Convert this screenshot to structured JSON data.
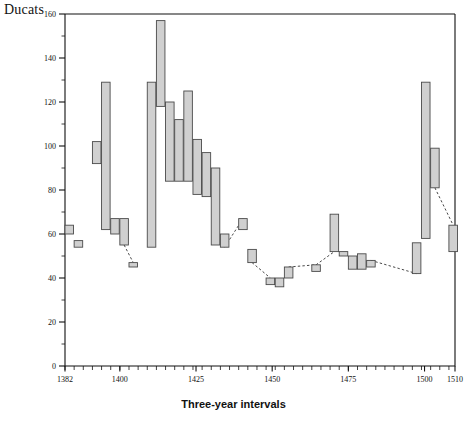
{
  "chart_data": {
    "type": "bar",
    "subtype": "high-low-range-bars",
    "title": "",
    "xlabel": "Three-year intervals",
    "ylabel": "Ducats",
    "ylim": [
      0,
      160
    ],
    "xlim": [
      1382,
      1510
    ],
    "y_major_ticks": [
      0,
      20,
      40,
      60,
      80,
      100,
      120,
      140,
      160
    ],
    "y_minor_tick_step": 10,
    "x_tick_labels": [
      "1382",
      "1400",
      "1425",
      "1450",
      "1475",
      "1500",
      "1510"
    ],
    "x_tick_values": [
      1382,
      1400,
      1425,
      1450,
      1475,
      1500,
      1510
    ],
    "x_tick_step_years": 3,
    "grid": false,
    "legend": null,
    "bar_fill_color": "#d0d0d0",
    "bar_edge_color": "#4a4a4a",
    "connector_style": "dashed",
    "bars": [
      {
        "x": 1382,
        "low": 60,
        "high": 64
      },
      {
        "x": 1385,
        "low": 54,
        "high": 57
      },
      {
        "x": 1391,
        "low": 92,
        "high": 102
      },
      {
        "x": 1394,
        "low": 62,
        "high": 129
      },
      {
        "x": 1397,
        "low": 60,
        "high": 67
      },
      {
        "x": 1400,
        "low": 55,
        "high": 67
      },
      {
        "x": 1403,
        "low": 45,
        "high": 47
      },
      {
        "x": 1409,
        "low": 54,
        "high": 129
      },
      {
        "x": 1412,
        "low": 118,
        "high": 157
      },
      {
        "x": 1415,
        "low": 84,
        "high": 120
      },
      {
        "x": 1418,
        "low": 84,
        "high": 112
      },
      {
        "x": 1421,
        "low": 84,
        "high": 125
      },
      {
        "x": 1424,
        "low": 78,
        "high": 103
      },
      {
        "x": 1427,
        "low": 77,
        "high": 97
      },
      {
        "x": 1430,
        "low": 55,
        "high": 90
      },
      {
        "x": 1433,
        "low": 54,
        "high": 60
      },
      {
        "x": 1439,
        "low": 62,
        "high": 67
      },
      {
        "x": 1442,
        "low": 47,
        "high": 53
      },
      {
        "x": 1448,
        "low": 37,
        "high": 40
      },
      {
        "x": 1451,
        "low": 36,
        "high": 40
      },
      {
        "x": 1454,
        "low": 40,
        "high": 45
      },
      {
        "x": 1463,
        "low": 43,
        "high": 46
      },
      {
        "x": 1469,
        "low": 52,
        "high": 69
      },
      {
        "x": 1472,
        "low": 50,
        "high": 52
      },
      {
        "x": 1475,
        "low": 44,
        "high": 50
      },
      {
        "x": 1478,
        "low": 44,
        "high": 51
      },
      {
        "x": 1481,
        "low": 45,
        "high": 48
      },
      {
        "x": 1496,
        "low": 42,
        "high": 56
      },
      {
        "x": 1499,
        "low": 58,
        "high": 129
      },
      {
        "x": 1502,
        "low": 81,
        "high": 99
      },
      {
        "x": 1508,
        "low": 52,
        "high": 64
      }
    ],
    "connectors": [
      {
        "from_x": 1400,
        "from_y": 55,
        "to_x": 1403,
        "to_y": 47
      },
      {
        "from_x": 1433,
        "from_y": 54,
        "to_x": 1439,
        "to_y": 67
      },
      {
        "from_x": 1442,
        "from_y": 47,
        "to_x": 1448,
        "to_y": 40
      },
      {
        "from_x": 1454,
        "from_y": 45,
        "to_x": 1463,
        "to_y": 46
      },
      {
        "from_x": 1463,
        "from_y": 46,
        "to_x": 1469,
        "to_y": 52
      },
      {
        "from_x": 1481,
        "from_y": 48,
        "to_x": 1496,
        "to_y": 42
      },
      {
        "from_x": 1502,
        "from_y": 81,
        "to_x": 1508,
        "to_y": 64
      }
    ]
  },
  "axis": {
    "y_title": "Ducats",
    "x_title": "Three-year intervals"
  }
}
